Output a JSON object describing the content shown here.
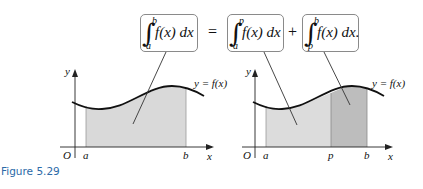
{
  "figure": {
    "caption": "Figure 5.29",
    "equation": {
      "lhs": {
        "upper": "b",
        "lower": "a",
        "integrand": "f(x) dx"
      },
      "equals": "=",
      "term1": {
        "upper": "p",
        "lower": "a",
        "integrand": "f(x) dx"
      },
      "plus": "+",
      "term2": {
        "upper": "b",
        "lower": "p",
        "integrand": "f(x) dx."
      }
    },
    "left_graph": {
      "y_axis_label": "y",
      "x_axis_label": "x",
      "origin_label": "O",
      "tick_a": "a",
      "tick_b": "b",
      "curve_label": "y = f(x)",
      "shade_color": "#d9d9d9"
    },
    "right_graph": {
      "y_axis_label": "y",
      "x_axis_label": "x",
      "origin_label": "O",
      "tick_a": "a",
      "tick_p": "p",
      "tick_b": "b",
      "curve_label": "y = f(x)",
      "shade_color_1": "#d9d9d9",
      "shade_color_2": "#bdbdbd"
    },
    "colors": {
      "caption": "#2b6aa8",
      "box_border": "#8a8a8a",
      "curve": "#111111"
    }
  }
}
